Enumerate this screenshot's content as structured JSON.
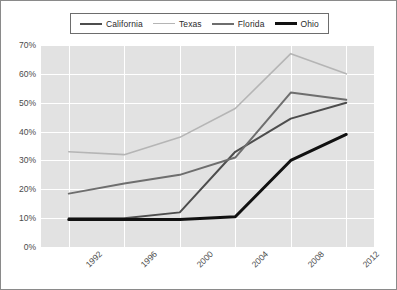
{
  "legend": {
    "position": "top",
    "items": [
      {
        "label": "California",
        "color": "#4d4d4d",
        "width": 2.0
      },
      {
        "label": "Texas",
        "color": "#b5b5b5",
        "width": 1.6
      },
      {
        "label": "Florida",
        "color": "#6e6e6e",
        "width": 2.0
      },
      {
        "label": "Ohio",
        "color": "#111111",
        "width": 3.0
      }
    ]
  },
  "axes": {
    "y_ticks": [
      "0%",
      "10%",
      "20%",
      "30%",
      "40%",
      "50%",
      "60%",
      "70%"
    ],
    "x_ticks": [
      "1992",
      "1996",
      "2000",
      "2004",
      "2008",
      "2012"
    ]
  },
  "colors": {
    "plot_background": "#e2e2e2",
    "gridline": "#ffffff",
    "border": "#8a8a8a",
    "tick_text": "#4a4a4a",
    "legend_text": "#2b2b2b"
  },
  "chart_data": {
    "type": "line",
    "title": "",
    "xlabel": "",
    "ylabel": "",
    "categories": [
      "1992",
      "1996",
      "2000",
      "2004",
      "2008",
      "2012"
    ],
    "x": [
      1992,
      1996,
      2000,
      2004,
      2008,
      2012
    ],
    "ylim": [
      0,
      70
    ],
    "ytick_step": 10,
    "y_unit": "%",
    "grid": true,
    "legend_position": "top",
    "series": [
      {
        "name": "California",
        "color": "#4d4d4d",
        "width": 2.0,
        "values": [
          10,
          10,
          12,
          33,
          44.5,
          50
        ]
      },
      {
        "name": "Texas",
        "color": "#b5b5b5",
        "width": 1.6,
        "values": [
          33,
          32,
          38,
          48,
          67,
          60
        ]
      },
      {
        "name": "Florida",
        "color": "#6e6e6e",
        "width": 2.0,
        "values": [
          18.5,
          22,
          25,
          31,
          53.5,
          51
        ]
      },
      {
        "name": "Ohio",
        "color": "#111111",
        "width": 3.0,
        "values": [
          9.5,
          9.5,
          9.5,
          10.5,
          30,
          39
        ]
      }
    ]
  }
}
